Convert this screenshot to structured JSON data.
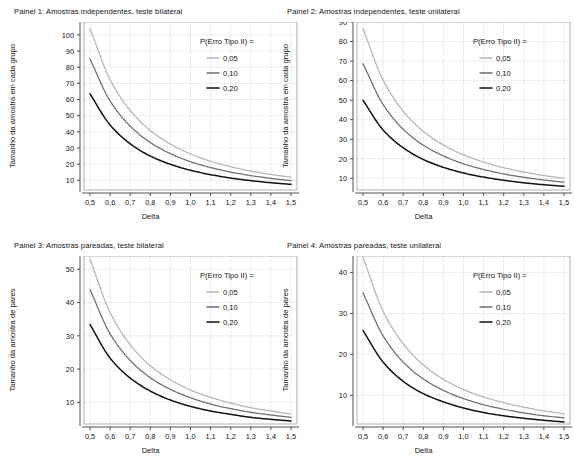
{
  "figure": {
    "background": "#ffffff",
    "layout": "2x2 grid of line charts",
    "xlabel": "Delta",
    "legend_title": "P(Erro Tipo II) =",
    "series_colors": [
      "#b5b5b5",
      "#6e6e6e",
      "#121212"
    ],
    "series_names": [
      "0,05",
      "0,10",
      "0,20"
    ],
    "xticks": [
      "0,5",
      "0,6",
      "0,7",
      "0,8",
      "0,9",
      "1,0",
      "1,1",
      "1,2",
      "1,3",
      "1,4",
      "1,5"
    ]
  },
  "chart_data": [
    {
      "type": "line",
      "title": "Painel 1: Amostras independentes, teste bilateral",
      "xlabel": "Delta",
      "ylabel": "Tamanho da amostra em cada grupo",
      "xlim": [
        0.47,
        1.53
      ],
      "ylim": [
        4,
        108
      ],
      "xticks": [
        0.5,
        0.6,
        0.7,
        0.8,
        0.9,
        1.0,
        1.1,
        1.2,
        1.3,
        1.4,
        1.5
      ],
      "xticklabels": [
        "0,5",
        "0,6",
        "0,7",
        "0,8",
        "0,9",
        "1,0",
        "1,1",
        "1,2",
        "1,3",
        "1,4",
        "1,5"
      ],
      "yticks": [
        10,
        20,
        30,
        40,
        50,
        60,
        70,
        80,
        90,
        100
      ],
      "yticklabels": [
        "10",
        "20",
        "30",
        "40",
        "50",
        "60",
        "70",
        "80",
        "90",
        "100"
      ],
      "grid": true,
      "legend_position": "upper right",
      "legend_title": "P(Erro Tipo II) =",
      "x": [
        0.5,
        0.6,
        0.7,
        0.8,
        0.9,
        1.0,
        1.1,
        1.2,
        1.3,
        1.4,
        1.5
      ],
      "series": [
        {
          "name": "0,05",
          "color": "#b5b5b5",
          "values": [
            104.0,
            72.3,
            53.2,
            40.8,
            32.4,
            26.3,
            21.8,
            18.4,
            15.7,
            13.6,
            11.9
          ]
        },
        {
          "name": "0,10",
          "color": "#6e6e6e",
          "values": [
            85.0,
            59.1,
            43.5,
            33.4,
            26.5,
            21.5,
            17.9,
            15.1,
            12.9,
            11.2,
            9.8
          ]
        },
        {
          "name": "0,20",
          "color": "#121212",
          "values": [
            63.5,
            44.2,
            32.6,
            25.0,
            19.9,
            16.2,
            13.5,
            11.4,
            9.8,
            8.5,
            7.5
          ]
        }
      ]
    },
    {
      "type": "line",
      "title": "Painel 2: Amostras independentes, teste unilateral",
      "xlabel": "Delta",
      "ylabel": "Tamanho da amostra em cada grupo",
      "xlim": [
        0.47,
        1.53
      ],
      "ylim": [
        4,
        90
      ],
      "xticks": [
        0.5,
        0.6,
        0.7,
        0.8,
        0.9,
        1.0,
        1.1,
        1.2,
        1.3,
        1.4,
        1.5
      ],
      "xticklabels": [
        "0,5",
        "0,6",
        "0,7",
        "0,8",
        "0,9",
        "1,0",
        "1,1",
        "1,2",
        "1,3",
        "1,4",
        "1,5"
      ],
      "yticks": [
        10,
        20,
        30,
        40,
        50,
        60,
        70,
        80,
        90
      ],
      "yticklabels": [
        "10",
        "20",
        "30",
        "40",
        "50",
        "60",
        "70",
        "80",
        "90"
      ],
      "grid": true,
      "legend_position": "upper right",
      "legend_title": "P(Erro Tipo II) =",
      "x": [
        0.5,
        0.6,
        0.7,
        0.8,
        0.9,
        1.0,
        1.1,
        1.2,
        1.3,
        1.4,
        1.5
      ],
      "series": [
        {
          "name": "0,05",
          "color": "#b5b5b5",
          "values": [
            86.6,
            60.2,
            44.3,
            34.0,
            27.0,
            22.0,
            18.3,
            15.4,
            13.2,
            11.4,
            10.0
          ]
        },
        {
          "name": "0,10",
          "color": "#6e6e6e",
          "values": [
            68.6,
            47.7,
            35.1,
            26.9,
            21.4,
            17.4,
            14.5,
            12.2,
            10.5,
            9.1,
            8.0
          ]
        },
        {
          "name": "0,20",
          "color": "#121212",
          "values": [
            49.9,
            34.7,
            25.6,
            19.6,
            15.6,
            12.7,
            10.6,
            9.0,
            7.7,
            6.7,
            5.9
          ]
        }
      ]
    },
    {
      "type": "line",
      "title": "Painel 3: Amostras pareadas, teste bilateral",
      "xlabel": "Delta",
      "ylabel": "Tamanho da amostra de pares",
      "xlim": [
        0.47,
        1.53
      ],
      "ylim": [
        3.5,
        54
      ],
      "xticks": [
        0.5,
        0.6,
        0.7,
        0.8,
        0.9,
        1.0,
        1.1,
        1.2,
        1.3,
        1.4,
        1.5
      ],
      "xticklabels": [
        "0,5",
        "0,6",
        "0,7",
        "0,8",
        "0,9",
        "1,0",
        "1,1",
        "1,2",
        "1,3",
        "1,4",
        "1,5"
      ],
      "yticks": [
        10,
        20,
        30,
        40,
        50
      ],
      "yticklabels": [
        "10",
        "20",
        "30",
        "40",
        "50"
      ],
      "grid": true,
      "legend_position": "upper right",
      "legend_title": "P(Erro Tipo II) =",
      "x": [
        0.5,
        0.6,
        0.7,
        0.8,
        0.9,
        1.0,
        1.1,
        1.2,
        1.3,
        1.4,
        1.5
      ],
      "series": [
        {
          "name": "0,05",
          "color": "#b5b5b5",
          "values": [
            53.0,
            37.0,
            27.3,
            21.0,
            16.8,
            13.7,
            11.5,
            9.8,
            8.4,
            7.4,
            6.5
          ]
        },
        {
          "name": "0,10",
          "color": "#6e6e6e",
          "values": [
            43.9,
            30.6,
            22.6,
            17.4,
            13.9,
            11.4,
            9.5,
            8.1,
            7.0,
            6.2,
            5.5
          ]
        },
        {
          "name": "0,20",
          "color": "#121212",
          "values": [
            33.4,
            23.3,
            17.3,
            13.4,
            10.7,
            8.8,
            7.4,
            6.4,
            5.5,
            4.9,
            4.4
          ]
        }
      ]
    },
    {
      "type": "line",
      "title": "Painel 4: Amostras pareadas, teste unilateral",
      "xlabel": "Delta",
      "ylabel": "Tamanho da amostra de pares",
      "xlim": [
        0.47,
        1.53
      ],
      "ylim": [
        3,
        44
      ],
      "xticks": [
        0.5,
        0.6,
        0.7,
        0.8,
        0.9,
        1.0,
        1.1,
        1.2,
        1.3,
        1.4,
        1.5
      ],
      "xticklabels": [
        "0,5",
        "0,6",
        "0,7",
        "0,8",
        "0,9",
        "1,0",
        "1,1",
        "1,2",
        "1,3",
        "1,4",
        "1,5"
      ],
      "yticks": [
        10,
        20,
        30,
        40
      ],
      "yticklabels": [
        "10",
        "20",
        "30",
        "40"
      ],
      "grid": true,
      "legend_position": "upper right",
      "legend_title": "P(Erro Tipo II) =",
      "x": [
        0.5,
        0.6,
        0.7,
        0.8,
        0.9,
        1.0,
        1.1,
        1.2,
        1.3,
        1.4,
        1.5
      ],
      "series": [
        {
          "name": "0,05",
          "color": "#b5b5b5",
          "values": [
            43.7,
            30.5,
            22.6,
            17.4,
            13.9,
            11.4,
            9.6,
            8.2,
            7.1,
            6.2,
            5.5
          ]
        },
        {
          "name": "0,10",
          "color": "#6e6e6e",
          "values": [
            35.0,
            24.5,
            18.1,
            14.0,
            11.2,
            9.2,
            7.7,
            6.6,
            5.7,
            5.0,
            4.5
          ]
        },
        {
          "name": "0,20",
          "color": "#121212",
          "values": [
            25.8,
            18.1,
            13.4,
            10.4,
            8.4,
            6.9,
            5.8,
            5.0,
            4.4,
            3.9,
            3.5
          ]
        }
      ]
    }
  ]
}
